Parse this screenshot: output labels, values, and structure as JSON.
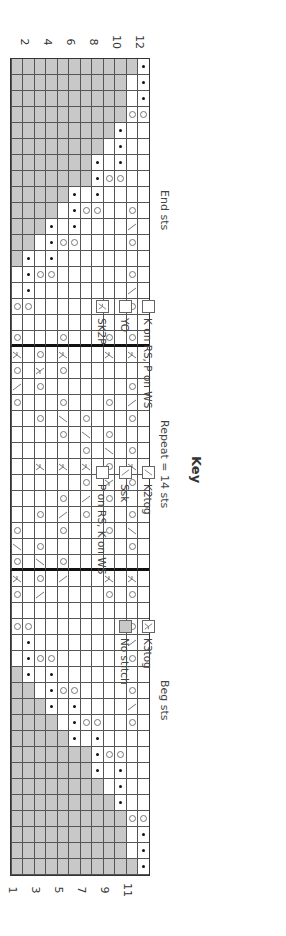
{
  "chart": {
    "rows": 12,
    "stitches": 51,
    "row_labels_left": [
      "12",
      "10",
      "8",
      "6",
      "4",
      "2"
    ],
    "row_labels_right": [
      "11",
      "9",
      "7",
      "5",
      "3",
      "1"
    ],
    "section_labels": {
      "end": "End sts",
      "repeat": "Repeat = 14 sts",
      "beg": "Beg sts"
    },
    "repeat_boundaries_after_stitch": [
      18,
      32
    ],
    "grid_note": "Each string is one stitch column (leftmost = chart left); characters are rows 12 (top) to 1 (bottom). G=no stitch, K=knit, P=purl, O=yo, /=k2tog, \\=ssk, A=sk2p, C=k3tog",
    "columns": [
      "PGGGGGGGGGGG",
      "PKGGGGGGGGGG",
      "PKGGGGGGGGGG",
      "OOGGGGGGGGGG",
      "KKPGGGGGGGGG",
      "KKPKGGGGGGGG",
      "KKPKPGGGGGGG",
      "KKOOPGGGGGGG",
      "KKKKPKPGGGGG",
      "KOKKOOPKGGGG",
      "K\\KKKKPKPGGG",
      "KOKKKKOOPKGG",
      "KKKKKKKKPKPG",
      "KOKKKKKKOOPK",
      "K\\KKKKKKKKPK",
      "KOKKKKKKKKOO",
      "KKKKKKKKKKKK",
      "KOKOKKKOKKKO",
      "KAKAKKKAKOKA",
      "KKKKKKKOKCKO",
      "KOKKKKKKKOK\\",
      "K\\KOKKKOKKKO",
      "KOKKKOK/KOKK",
      "KKKOK/KOKKKK",
      "KOK/KOKKKKKK",
      "KAKOKAKAKAKK",
      "KOKCKOKKKKKK",
      "KKKOK\\KOKKKK",
      "KOKKKOK\\KOKK",
      "K/KOKKKOKKKO",
      "KOKKKKKKKOK/",
      "KKKKKKKOK/KO",
      "KAKAKKK\\KOKA",
      "KOKOKKKKK\\KO",
      "KKKKKKKKKKKK",
      "KOKKKKKKKKOO",
      "K\\KKKKKKKKPK",
      "KOKKKKKKOOPK",
      "KKKKKKKKPKPG",
      "KOKKKKOOPKGG",
      "K\\KKKKPKPGGG",
      "KOKKOOPKGGGG",
      "KKKKPKPGGGGG",
      "KKOOPGGGGGGG",
      "KKPKPGGGGGGG",
      "KKPKGGGGGGGG",
      "KKPGGGGGGGGG",
      "OOGGGGGGGGGG",
      "PKGGGGGGGGGG",
      "PKGGGGGGGGGG",
      "PGGGGGGGGGGG"
    ]
  },
  "key": {
    "title": "Key",
    "items": [
      {
        "symbol": "knit",
        "label": "K on RS, P on WS"
      },
      {
        "symbol": "yo",
        "label": "YO"
      },
      {
        "symbol": "sk2p",
        "label": "SK2P"
      },
      {
        "symbol": "k2tog",
        "label": "K2tog"
      },
      {
        "symbol": "ssk",
        "label": "Ssk"
      },
      {
        "symbol": "purl",
        "label": "P on RS, K on WS"
      },
      {
        "symbol": "k3tog",
        "label": "K3tog"
      },
      {
        "symbol": "no-stitch",
        "label": "No stitch"
      }
    ]
  },
  "colors": {
    "no_stitch": "#c8c8c8",
    "grid_line": "#555555",
    "repeat_line": "#111111"
  }
}
